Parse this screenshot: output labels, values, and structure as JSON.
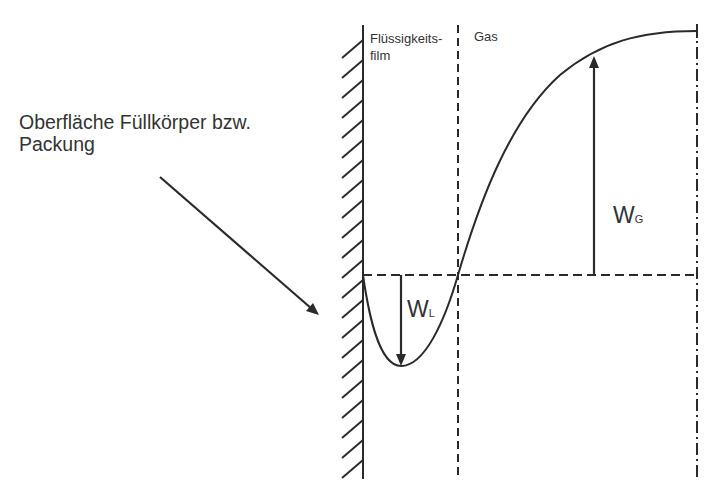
{
  "diagram": {
    "surface_label_line1": "Oberfläche Füllkörper bzw.",
    "surface_label_line2": "Packung",
    "zones": {
      "liquid_line1": "Flüssigkeits-",
      "liquid_line2": "film",
      "gas": "Gas"
    },
    "symbols": {
      "wl_main": "W",
      "wl_sub": "L",
      "wg_main": "W",
      "wg_sub": "G"
    },
    "colors": {
      "line": "#2a2a2a",
      "background": "#ffffff"
    }
  }
}
